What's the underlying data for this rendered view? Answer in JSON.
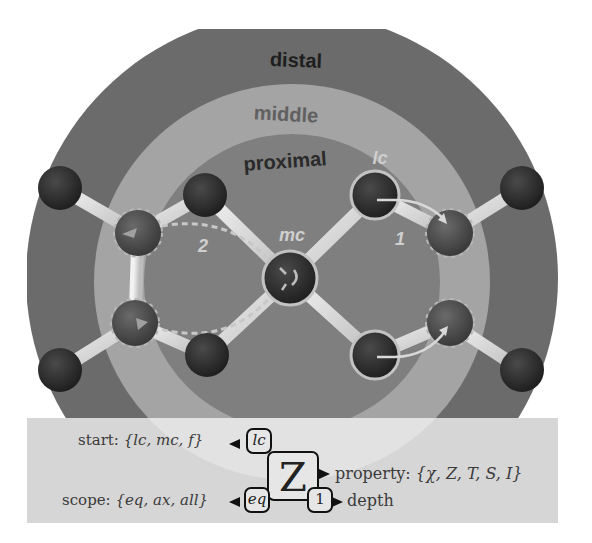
{
  "rings": {
    "distal": {
      "label": "distal",
      "color": "#6b6b6b",
      "text_color": "#1e1e1e"
    },
    "middle": {
      "label": "middle",
      "color": "#a4a4a4",
      "text_color": "#606060"
    },
    "proximal": {
      "label": "proximal",
      "color": "#7f7f7f",
      "text_color": "#2a2a2a"
    }
  },
  "atom_labels": {
    "lc": "lc",
    "mc": "mc",
    "path_1": "1",
    "path_2": "2"
  },
  "colors": {
    "background": "#ffffff",
    "lower_band": "#d9d9d9",
    "lower_band_inner": "#e6e6e6",
    "atom_dark": "#2e2e2e",
    "atom_mid": "#4e4e4e",
    "bond": "#dcdcdc",
    "highlight_outline": "#c2c2c2"
  },
  "legend": {
    "start": {
      "label": "start:",
      "set": "{lc, mc, f}"
    },
    "property": {
      "label": "property:",
      "set": "{χ, Z, T, S, I}"
    },
    "scope": {
      "label": "scope:",
      "set": "{eq, ax, all}"
    },
    "depth": {
      "label": "depth"
    }
  },
  "descriptor": {
    "property_symbol": "Z",
    "start_value": "lc",
    "scope_value": "eq",
    "depth_value": "1"
  }
}
